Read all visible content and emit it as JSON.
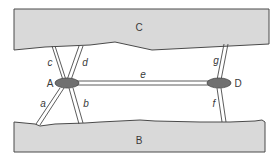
{
  "diagram": {
    "type": "strut-link diagram",
    "colors": {
      "block_fill": "#d9d9d9",
      "block_stroke": "#4a4a4a",
      "node_fill": "#707070",
      "node_stroke": "#4a4a4a",
      "line_stroke": "#4a4a4a",
      "label": "#3a3a3a"
    },
    "blocks": [
      {
        "id": "C",
        "label": "C",
        "position": "top"
      },
      {
        "id": "B",
        "label": "B",
        "position": "bottom"
      }
    ],
    "nodes": [
      {
        "id": "A",
        "label": "A",
        "shape": "ellipse"
      },
      {
        "id": "D",
        "label": "D",
        "shape": "ellipse"
      }
    ],
    "links": [
      {
        "label": "a",
        "from": "A",
        "to": "B"
      },
      {
        "label": "b",
        "from": "A",
        "to": "B"
      },
      {
        "label": "c",
        "from": "A",
        "to": "C"
      },
      {
        "label": "d",
        "from": "A",
        "to": "C"
      },
      {
        "label": "e",
        "from": "A",
        "to": "D"
      },
      {
        "label": "f",
        "from": "D",
        "to": "B"
      },
      {
        "label": "g",
        "from": "D",
        "to": "C"
      }
    ]
  }
}
